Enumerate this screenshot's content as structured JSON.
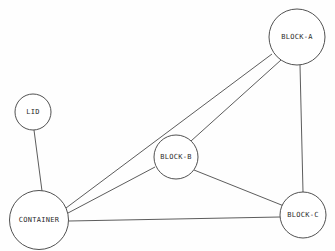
{
  "diagram": {
    "type": "node-link-graph",
    "background_color": "#fefefe",
    "line_color": "#4a4a4a",
    "node_fill": "#ffffff",
    "node_stroke": "#3d3d3d",
    "label_color": "#2b2b2b",
    "width": 335,
    "height": 251,
    "nodes": [
      {
        "id": "lid",
        "label": "LID",
        "cx": 33,
        "cy": 112,
        "r": 18,
        "font_size": 7.0
      },
      {
        "id": "container",
        "label": "CONTAINER",
        "cx": 39,
        "cy": 220,
        "r": 29.5,
        "font_size": 7.0
      },
      {
        "id": "block_b",
        "label": "BLOCK-B",
        "cx": 176,
        "cy": 157,
        "r": 22,
        "font_size": 7.0
      },
      {
        "id": "block_a",
        "label": "BLOCK-A",
        "cx": 297,
        "cy": 37,
        "r": 28,
        "font_size": 7.0
      },
      {
        "id": "block_c",
        "label": "BLOCK-C",
        "cx": 303,
        "cy": 215,
        "r": 23,
        "font_size": 7.0
      }
    ],
    "edges": [
      {
        "id": "lid-container",
        "from": "lid",
        "to": "container",
        "x1": 34,
        "y1": 130,
        "x2": 42,
        "y2": 191
      },
      {
        "id": "container-block_a",
        "from": "container",
        "to": "block_a",
        "x1": 66,
        "y1": 208,
        "x2": 272,
        "y2": 54
      },
      {
        "id": "container-block_b",
        "from": "container",
        "to": "block_b",
        "x1": 68,
        "y1": 213,
        "x2": 155,
        "y2": 167
      },
      {
        "id": "container-block_c",
        "from": "container",
        "to": "block_c",
        "x1": 69,
        "y1": 221,
        "x2": 280,
        "y2": 217
      },
      {
        "id": "block_b-block_a",
        "from": "block_b",
        "to": "block_a",
        "x1": 191,
        "y1": 141,
        "x2": 281,
        "y2": 60
      },
      {
        "id": "block_b-block_c",
        "from": "block_b",
        "to": "block_c",
        "x1": 194,
        "y1": 170,
        "x2": 284,
        "y2": 206
      },
      {
        "id": "block_a-block_c",
        "from": "block_a",
        "to": "block_c",
        "x1": 300,
        "y1": 65,
        "x2": 303,
        "y2": 192
      }
    ]
  }
}
